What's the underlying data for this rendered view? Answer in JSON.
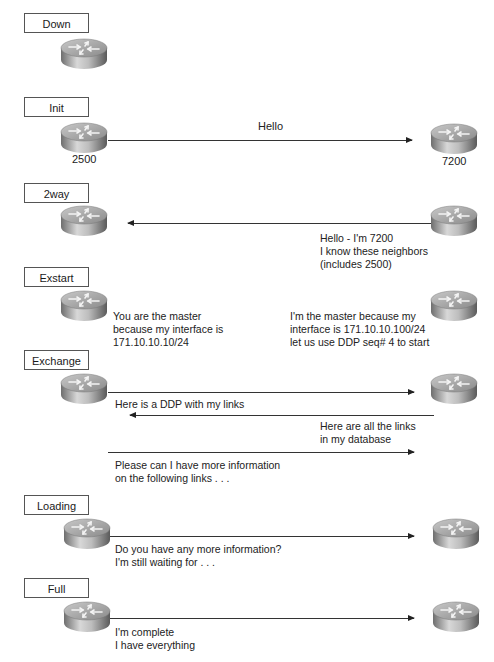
{
  "diagram": {
    "routers": {
      "left_label": "2500",
      "right_label": "7200"
    },
    "states": [
      {
        "name": "Down"
      },
      {
        "name": "Init",
        "messages": [
          {
            "direction": "right",
            "text": "Hello"
          }
        ]
      },
      {
        "name": "2way",
        "messages": [
          {
            "direction": "left",
            "text": "Hello - I'm 7200\nI know these neighbors\n(includes 2500)"
          }
        ]
      },
      {
        "name": "Exstart",
        "left_text": "You are the master\nbecause my interface is\n171.10.10.10/24",
        "right_text": "I'm the master because my\ninterface is 171.10.10.100/24\nlet us use DDP seq# 4 to start"
      },
      {
        "name": "Exchange",
        "messages": [
          {
            "direction": "right",
            "text": "Here is a DDP with my links"
          },
          {
            "direction": "left",
            "text": "Here are all the links\nin my database"
          },
          {
            "direction": "right",
            "text": "Please can I have more information\non the following links . . ."
          }
        ]
      },
      {
        "name": "Loading",
        "messages": [
          {
            "direction": "right",
            "text": "Do you have any more information?\nI'm still waiting for . . ."
          }
        ]
      },
      {
        "name": "Full",
        "messages": [
          {
            "direction": "right",
            "text": "I'm complete\nI have everything"
          }
        ]
      }
    ]
  }
}
